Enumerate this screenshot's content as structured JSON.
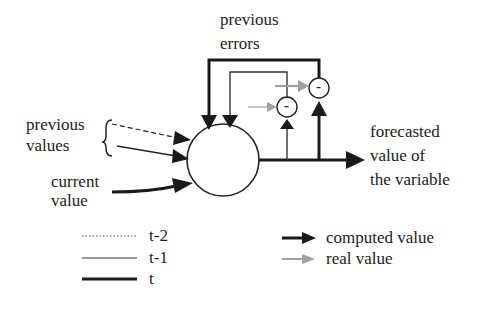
{
  "diagram": {
    "labels": {
      "previous_errors_1": "previous",
      "previous_errors_2": "errors",
      "previous_values_1": "previous",
      "previous_values_2": "values",
      "current_value_1": "current",
      "current_value_2": "value",
      "forecast_1": "forecasted",
      "forecast_2": "value of",
      "forecast_3": "the variable"
    },
    "subtract_symbol": "-",
    "colors": {
      "computed": "#1a1a1a",
      "real": "#a0a0a0"
    }
  },
  "legend": {
    "line_styles": [
      {
        "label": "t-2",
        "style": "dotted"
      },
      {
        "label": "t-1",
        "style": "thin"
      },
      {
        "label": "t",
        "style": "thick"
      }
    ],
    "arrows": [
      {
        "label": "computed value",
        "color": "#1a1a1a"
      },
      {
        "label": "real value",
        "color": "#a0a0a0"
      }
    ]
  }
}
